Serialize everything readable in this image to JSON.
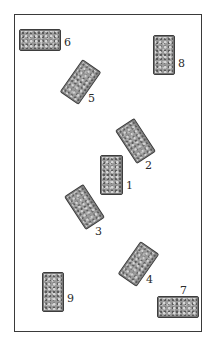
{
  "diagram": {
    "type": "card-spread-layout",
    "frame": {
      "left": 14,
      "top": 14,
      "right": 202,
      "bottom": 332
    },
    "cards": [
      {
        "label": "1",
        "cx": 111,
        "cy": 175,
        "w": 23,
        "h": 40,
        "rotate": 0,
        "lx": 126,
        "ly": 180
      },
      {
        "label": "2",
        "cx": 135,
        "cy": 141,
        "w": 23,
        "h": 40,
        "rotate": -33,
        "lx": 145,
        "ly": 160
      },
      {
        "label": "3",
        "cx": 84,
        "cy": 207,
        "w": 23,
        "h": 40,
        "rotate": -33,
        "lx": 95,
        "ly": 226
      },
      {
        "label": "4",
        "cx": 138,
        "cy": 264,
        "w": 23,
        "h": 40,
        "rotate": 35,
        "lx": 146,
        "ly": 274
      },
      {
        "label": "5",
        "cx": 80,
        "cy": 82,
        "w": 23,
        "h": 40,
        "rotate": 35,
        "lx": 88,
        "ly": 93
      },
      {
        "label": "6",
        "cx": 40,
        "cy": 40,
        "w": 42,
        "h": 22,
        "rotate": 0,
        "lx": 64,
        "ly": 37
      },
      {
        "label": "7",
        "cx": 178,
        "cy": 307,
        "w": 42,
        "h": 22,
        "rotate": 0,
        "lx": 180,
        "ly": 285
      },
      {
        "label": "8",
        "cx": 164,
        "cy": 55,
        "w": 22,
        "h": 40,
        "rotate": 0,
        "lx": 178,
        "ly": 58
      },
      {
        "label": "9",
        "cx": 53,
        "cy": 292,
        "w": 22,
        "h": 40,
        "rotate": 0,
        "lx": 67,
        "ly": 293
      }
    ]
  },
  "colors": {
    "frame": "#3a3a3a",
    "card_fill": "#9a9a9a",
    "card_border": "#3d3d3d",
    "label": "#2a2a2a"
  }
}
